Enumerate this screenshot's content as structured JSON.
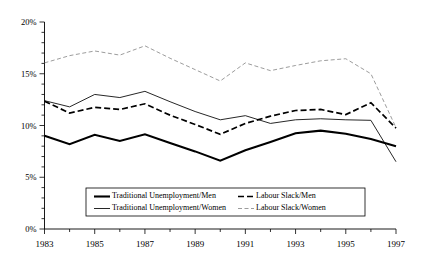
{
  "chart_data": {
    "type": "line",
    "title": "",
    "subtitle": "",
    "xlabel": "",
    "ylabel": "",
    "xlim": [
      1983,
      1997
    ],
    "ylim": [
      0,
      20
    ],
    "grid": false,
    "legend_position": "inside-bottom-center",
    "x": [
      1983,
      1984,
      1985,
      1986,
      1987,
      1988,
      1989,
      1990,
      1991,
      1992,
      1993,
      1994,
      1995,
      1996,
      1997
    ],
    "x_tick_labels": [
      "1983",
      "",
      "1985",
      "",
      "1987",
      "",
      "1989",
      "",
      "1991",
      "",
      "1993",
      "",
      "1995",
      "",
      "1997"
    ],
    "x_major_ticks": [
      1983,
      1985,
      1987,
      1989,
      1991,
      1993,
      1995,
      1997
    ],
    "y_tick_labels": [
      "0%",
      "5%",
      "10%",
      "15%",
      "20%"
    ],
    "y_ticks": [
      0,
      5,
      10,
      15,
      20
    ],
    "y_minor_tick_step": 1,
    "series": [
      {
        "name": "Traditional Unemployment/Men",
        "style": "solid-thick",
        "color": "#000000",
        "width": 2.1,
        "dash": "",
        "values": [
          9.0,
          8.2,
          9.1,
          8.5,
          9.15,
          8.3,
          7.5,
          6.6,
          7.6,
          8.4,
          9.25,
          9.5,
          9.2,
          8.7,
          8.0
        ]
      },
      {
        "name": "Labour Slack/Men",
        "style": "dashed-thick",
        "color": "#000000",
        "width": 1.7,
        "dash": "6,3",
        "values": [
          12.35,
          11.2,
          11.75,
          11.55,
          12.1,
          11.0,
          10.1,
          9.15,
          10.2,
          10.9,
          11.45,
          11.55,
          11.05,
          12.2,
          9.75
        ]
      },
      {
        "name": "Traditional Unemployment/Women",
        "style": "solid-thin",
        "color": "#000000",
        "width": 0.85,
        "dash": "",
        "values": [
          12.4,
          11.8,
          13.0,
          12.7,
          13.3,
          12.3,
          11.35,
          10.55,
          10.95,
          10.2,
          10.55,
          10.65,
          10.55,
          10.5,
          6.5
        ]
      },
      {
        "name": "Labour Slack/Women",
        "style": "dashed-thin",
        "color": "#8a8a8a",
        "width": 0.85,
        "dash": "4,2.5",
        "values": [
          16.05,
          16.75,
          17.2,
          16.8,
          17.7,
          16.5,
          15.4,
          14.3,
          16.05,
          15.3,
          15.8,
          16.25,
          16.45,
          15.0,
          9.8
        ]
      }
    ],
    "legend": [
      {
        "label": "Traditional Unemployment/Men",
        "style": "solid-thick",
        "row": 0,
        "col": 0
      },
      {
        "label": "Labour Slack/Men",
        "style": "dashed-thick",
        "row": 0,
        "col": 1
      },
      {
        "label": "Traditional Unemployment/Women",
        "style": "solid-thin",
        "row": 1,
        "col": 0
      },
      {
        "label": "Labour Slack/Women",
        "style": "dashed-thin",
        "row": 1,
        "col": 1
      }
    ]
  }
}
